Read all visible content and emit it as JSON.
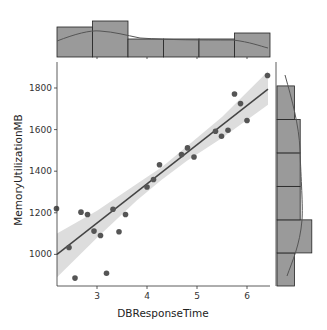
{
  "chart_data": {
    "type": "scatter",
    "subtype": "jointplot-regression",
    "title": "",
    "xlabel": "DBResponseTime",
    "ylabel": "MemoryUtilizationMB",
    "xlim": [
      2.2,
      6.46
    ],
    "ylim": [
      848,
      1925
    ],
    "xticks": [
      3,
      4,
      5,
      6
    ],
    "yticks": [
      1000,
      1200,
      1400,
      1600,
      1800
    ],
    "grid": false,
    "legend": null,
    "points": [
      {
        "x": 2.19,
        "y": 1220
      },
      {
        "x": 2.44,
        "y": 1033
      },
      {
        "x": 2.56,
        "y": 886
      },
      {
        "x": 2.68,
        "y": 1203
      },
      {
        "x": 2.81,
        "y": 1192
      },
      {
        "x": 2.94,
        "y": 1112
      },
      {
        "x": 3.07,
        "y": 1091
      },
      {
        "x": 3.19,
        "y": 909
      },
      {
        "x": 3.32,
        "y": 1217
      },
      {
        "x": 3.44,
        "y": 1109
      },
      {
        "x": 3.57,
        "y": 1192
      },
      {
        "x": 4.0,
        "y": 1324
      },
      {
        "x": 4.13,
        "y": 1360
      },
      {
        "x": 4.25,
        "y": 1431
      },
      {
        "x": 4.69,
        "y": 1480
      },
      {
        "x": 4.81,
        "y": 1512
      },
      {
        "x": 4.94,
        "y": 1468
      },
      {
        "x": 5.37,
        "y": 1592
      },
      {
        "x": 5.49,
        "y": 1568
      },
      {
        "x": 5.62,
        "y": 1597
      },
      {
        "x": 5.75,
        "y": 1771
      },
      {
        "x": 5.87,
        "y": 1725
      },
      {
        "x": 6.0,
        "y": 1644
      },
      {
        "x": 6.41,
        "y": 1860
      }
    ],
    "regression_line": {
      "x": [
        2.2,
        6.42
      ],
      "y": [
        1000,
        1795
      ]
    },
    "confidence_band": [
      {
        "x": 2.2,
        "lo": 890,
        "hi": 1100
      },
      {
        "x": 3.0,
        "lo": 1080,
        "hi": 1210
      },
      {
        "x": 3.8,
        "lo": 1260,
        "hi": 1340
      },
      {
        "x": 4.3,
        "lo": 1360,
        "hi": 1420
      },
      {
        "x": 4.8,
        "lo": 1450,
        "hi": 1520
      },
      {
        "x": 5.5,
        "lo": 1560,
        "hi": 1660
      },
      {
        "x": 6.42,
        "lo": 1720,
        "hi": 1880
      }
    ],
    "marginal_x_hist": {
      "bin_edges": [
        2.2,
        2.91,
        3.62,
        4.33,
        5.04,
        5.75,
        6.46
      ],
      "counts": [
        5,
        6,
        3,
        3,
        3,
        4
      ]
    },
    "marginal_y_hist": {
      "bin_edges": [
        848,
        1007,
        1166,
        1327,
        1488,
        1649,
        1810
      ],
      "counts_bottom_to_top": [
        3,
        6,
        4,
        4,
        4,
        3
      ]
    },
    "colors": {
      "points": "#555555",
      "line": "#444444",
      "band": "#dddddd",
      "hist_fill": "#9a9a9a",
      "hist_edge": "#222222",
      "kde": "#555555"
    }
  }
}
